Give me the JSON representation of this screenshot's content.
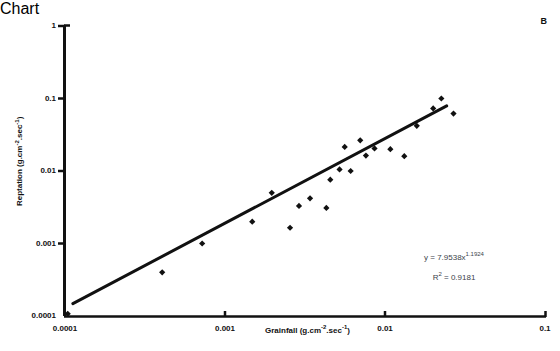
{
  "figure": {
    "panel_label": "B",
    "background": "#ffffff",
    "ink_color": "#111111",
    "annotation_color": "#3b3f4a"
  },
  "chart_data": {
    "type": "scatter",
    "title": "",
    "subtitle": "",
    "xlabel": "Grainfall (g.cm-2.sec-1)",
    "xlabel_parts": {
      "name": "Grainfall (g.cm",
      "sup1": "-2",
      "mid": ".sec",
      "sup2": "-1",
      "tail": ")"
    },
    "ylabel": "Reptation (g.cm-2.sec-1)",
    "ylabel_parts": {
      "name": "Reptation (g.cm",
      "sup1": "-2",
      "mid": ".sec",
      "sup2": "-1",
      "tail": ")"
    },
    "xscale": "log",
    "yscale": "log",
    "xlim": [
      0.0001,
      0.1
    ],
    "ylim": [
      0.0001,
      1
    ],
    "xticks": [
      "0.0001",
      "0.001",
      "0.01",
      "0.1"
    ],
    "xtick_values": [
      0.0001,
      0.001,
      0.01,
      0.1
    ],
    "yticks": [
      "0.0001",
      "0.001",
      "0.01",
      "0.1",
      "1"
    ],
    "ytick_values": [
      0.0001,
      0.001,
      0.01,
      0.1,
      1
    ],
    "grid": false,
    "legend": "none",
    "marker": "diamond",
    "marker_color": "#111111",
    "points": [
      {
        "x": 0.000104,
        "y": 0.000107
      },
      {
        "x": 0.000405,
        "y": 0.0004
      },
      {
        "x": 0.00072,
        "y": 0.001
      },
      {
        "x": 0.00148,
        "y": 0.002
      },
      {
        "x": 0.00196,
        "y": 0.005
      },
      {
        "x": 0.00255,
        "y": 0.00165
      },
      {
        "x": 0.0029,
        "y": 0.0033
      },
      {
        "x": 0.0034,
        "y": 0.0042
      },
      {
        "x": 0.0043,
        "y": 0.0031
      },
      {
        "x": 0.00455,
        "y": 0.0076
      },
      {
        "x": 0.0052,
        "y": 0.0105
      },
      {
        "x": 0.0056,
        "y": 0.0215
      },
      {
        "x": 0.0061,
        "y": 0.01
      },
      {
        "x": 0.007,
        "y": 0.0265
      },
      {
        "x": 0.0076,
        "y": 0.0163
      },
      {
        "x": 0.0086,
        "y": 0.0205
      },
      {
        "x": 0.0108,
        "y": 0.02
      },
      {
        "x": 0.0132,
        "y": 0.016
      },
      {
        "x": 0.0158,
        "y": 0.042
      },
      {
        "x": 0.02,
        "y": 0.073
      },
      {
        "x": 0.0225,
        "y": 0.1
      },
      {
        "x": 0.0268,
        "y": 0.062
      }
    ],
    "fit": {
      "equation": "y = 7.9538x1.1924",
      "equation_parts": {
        "lead": "y = 7.9538x",
        "exponent": "1.1924"
      },
      "r_squared_label": "R2 = 0.9181",
      "r_squared_parts": {
        "lead": "R",
        "sup": "2",
        "tail": " = 0.9181"
      },
      "coefficient": 7.9538,
      "exponent": 1.1924,
      "r_squared": 0.9181,
      "line_endpoints": [
        {
          "x": 0.000112,
          "y": 0.000148
        },
        {
          "x": 0.0243,
          "y": 0.079
        }
      ]
    }
  }
}
